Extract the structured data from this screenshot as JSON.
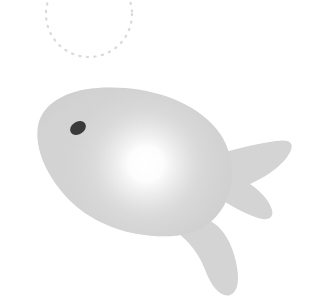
{
  "scene": {
    "title": "Stylized fish illustration",
    "width": 322,
    "height": 306,
    "background_color": "#ffffff"
  },
  "palette": {
    "background": "#ffffff",
    "body_fill": "#d4d4d4",
    "body_edge": "#cbcbcb",
    "body_shadow": "#c4c4c4",
    "highlight_core": "#ffffff",
    "highlight_mid": "#ececec",
    "eye_fill": "#3a3a3a",
    "dotted_circle": "#d9d9dd"
  },
  "objects": [
    {
      "id": "dotted-circle",
      "label": "Dotted circle outline",
      "shape": "circle",
      "center_x": 89,
      "center_y": 14,
      "radius": 43,
      "stroke_color": "#d9d9dd",
      "stroke_width": 2,
      "dash": "1 6",
      "cropped_at_top": true
    },
    {
      "id": "fish-body",
      "label": "Fish body",
      "shape": "teardrop",
      "fill": "#d4d4d4",
      "snout_x": 38,
      "snout_y": 126,
      "top_y": 89,
      "bottom_y": 232,
      "right_x": 232
    },
    {
      "id": "fish-tail",
      "label": "Forked tail fin",
      "shape": "forked",
      "fill": "#d4d4d4",
      "upper_tip_x": 292,
      "upper_tip_y": 144,
      "lower_tip_x": 268,
      "lower_tip_y": 214,
      "notch_x": 236,
      "notch_y": 181
    },
    {
      "id": "fish-bottom-fin",
      "label": "Bottom fin",
      "shape": "tapered",
      "fill": "#d4d4d4",
      "tip_x": 230,
      "tip_y": 295
    },
    {
      "id": "fish-eye",
      "label": "Fish eye",
      "shape": "ellipse",
      "center_x": 78,
      "center_y": 128,
      "radius_x": 8,
      "radius_y": 6,
      "rotation_deg": -32,
      "fill": "#3a3a3a"
    },
    {
      "id": "body-highlight",
      "label": "Radial highlight glow",
      "shape": "radial-gradient",
      "center_x": 146,
      "center_y": 164,
      "radius": 74,
      "core_color": "#ffffff"
    }
  ]
}
